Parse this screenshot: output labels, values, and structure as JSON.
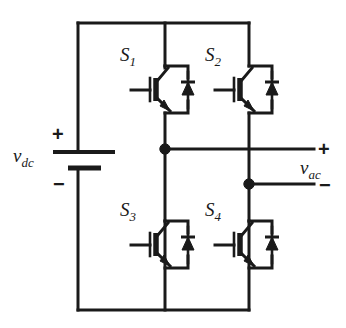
{
  "diagram": {
    "type": "circuit-schematic",
    "line_color": "#1a1a1a",
    "background_color": "#ffffff"
  },
  "source": {
    "label": "v",
    "label_sub": "dc",
    "plus_sign": "+",
    "minus_sign": "−",
    "symbol": "battery"
  },
  "output": {
    "label": "v",
    "label_sub": "ac",
    "plus_sign": "+",
    "minus_sign": "−"
  },
  "switches": [
    {
      "label": "S",
      "label_sub": "1",
      "position": "top-left",
      "device": "igbt-with-antiparallel-diode"
    },
    {
      "label": "S",
      "label_sub": "2",
      "position": "top-right",
      "device": "igbt-with-antiparallel-diode"
    },
    {
      "label": "S",
      "label_sub": "3",
      "position": "bottom-left",
      "device": "igbt-with-antiparallel-diode"
    },
    {
      "label": "S",
      "label_sub": "4",
      "position": "bottom-right",
      "device": "igbt-with-antiparallel-diode"
    }
  ],
  "nodes": [
    {
      "name": "left-leg-midpoint"
    },
    {
      "name": "right-leg-midpoint"
    }
  ]
}
